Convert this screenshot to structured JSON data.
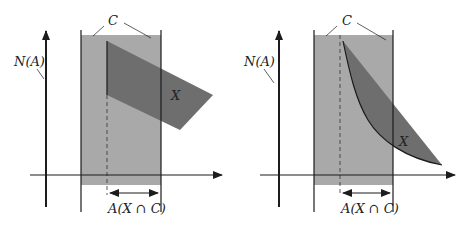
{
  "colors": {
    "background": "#ffffff",
    "region_c": "#a9a9a9",
    "region_x": "#6e6e6e",
    "lines": "#1c1c1c"
  },
  "panels": [
    {
      "id": "left",
      "labels": {
        "y_axis": "N(A)",
        "region_c": "C",
        "region_x": "X",
        "measure": "A(X ∩ C)"
      },
      "shape_x": "quadrilateral"
    },
    {
      "id": "right",
      "labels": {
        "y_axis": "N(A)",
        "region_c": "C",
        "region_x": "X",
        "measure": "A(X ∩ C)"
      },
      "shape_x": "curved-region"
    }
  ]
}
